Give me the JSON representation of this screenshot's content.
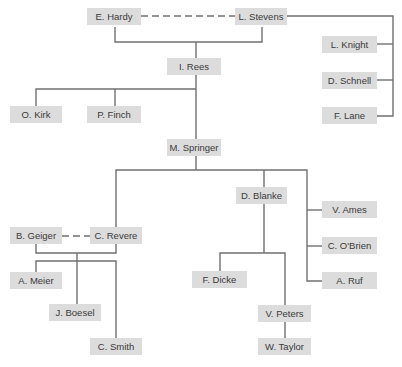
{
  "diagram": {
    "type": "organization-chart",
    "colors": {
      "box": "#dcdcdc",
      "line": "#707070",
      "text": "#3a3a3a"
    },
    "nodes": {
      "hardy": {
        "label": "E. Hardy"
      },
      "stevens": {
        "label": "L. Stevens"
      },
      "knight": {
        "label": "L. Knight"
      },
      "schnell": {
        "label": "D. Schnell"
      },
      "lane": {
        "label": "F. Lane"
      },
      "rees": {
        "label": "I. Rees"
      },
      "kirk": {
        "label": "O. Kirk"
      },
      "finch": {
        "label": "P. Finch"
      },
      "springer": {
        "label": "M. Springer"
      },
      "blanke": {
        "label": "D. Blanke"
      },
      "ames": {
        "label": "V. Ames"
      },
      "obrien": {
        "label": "C. O'Brien"
      },
      "ruf": {
        "label": "A. Ruf"
      },
      "geiger": {
        "label": "B. Geiger"
      },
      "revere": {
        "label": "C. Revere"
      },
      "meier": {
        "label": "A. Meier"
      },
      "boesel": {
        "label": "J. Boesel"
      },
      "smith": {
        "label": "C. Smith"
      },
      "dicke": {
        "label": "F. Dicke"
      },
      "peters": {
        "label": "V. Peters"
      },
      "taylor": {
        "label": "W. Taylor"
      }
    },
    "edges": [
      {
        "from": "E. Hardy",
        "to": "L. Stevens",
        "style": "dashed"
      },
      {
        "from": "E. Hardy + L. Stevens",
        "to": "I. Rees",
        "style": "solid"
      },
      {
        "from": "L. Stevens",
        "to": "L. Knight",
        "style": "solid"
      },
      {
        "from": "L. Stevens",
        "to": "D. Schnell",
        "style": "solid"
      },
      {
        "from": "L. Stevens",
        "to": "F. Lane",
        "style": "solid"
      },
      {
        "from": "I. Rees",
        "to": "O. Kirk",
        "style": "solid"
      },
      {
        "from": "I. Rees",
        "to": "P. Finch",
        "style": "solid"
      },
      {
        "from": "I. Rees",
        "to": "M. Springer",
        "style": "solid"
      },
      {
        "from": "M. Springer",
        "to": "C. Revere",
        "style": "solid"
      },
      {
        "from": "M. Springer",
        "to": "D. Blanke",
        "style": "solid"
      },
      {
        "from": "M. Springer",
        "to": "V. Ames",
        "style": "solid"
      },
      {
        "from": "M. Springer",
        "to": "C. O'Brien",
        "style": "solid"
      },
      {
        "from": "M. Springer",
        "to": "A. Ruf",
        "style": "solid"
      },
      {
        "from": "B. Geiger",
        "to": "C. Revere",
        "style": "dashed"
      },
      {
        "from": "B. Geiger + C. Revere",
        "to": "A. Meier",
        "style": "solid"
      },
      {
        "from": "B. Geiger + C. Revere",
        "to": "J. Boesel",
        "style": "solid"
      },
      {
        "from": "B. Geiger + C. Revere",
        "to": "C. Smith",
        "style": "solid"
      },
      {
        "from": "D. Blanke",
        "to": "F. Dicke",
        "style": "solid"
      },
      {
        "from": "D. Blanke",
        "to": "V. Peters",
        "style": "solid"
      },
      {
        "from": "V. Peters",
        "to": "W. Taylor",
        "style": "solid"
      }
    ]
  }
}
